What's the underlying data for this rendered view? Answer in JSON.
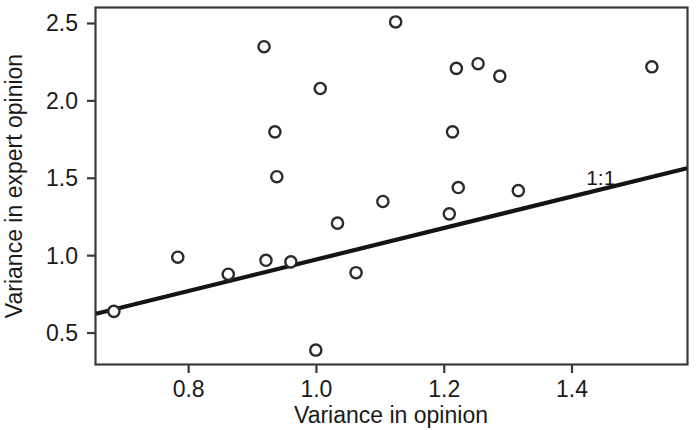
{
  "chart_data": {
    "type": "scatter",
    "title": "",
    "xlabel": "Variance in opinion",
    "ylabel": "Variance in expert opinion",
    "xlim": [
      0.655,
      1.58
    ],
    "ylim": [
      0.3,
      2.6
    ],
    "xticks": [
      0.8,
      1.0,
      1.2,
      1.4
    ],
    "xtick_labels": [
      "0.8",
      "1.0",
      "1.2",
      "1.4"
    ],
    "yticks": [
      0.5,
      1.0,
      1.5,
      2.0,
      2.5
    ],
    "ytick_labels": [
      "0.5",
      "1.0",
      "1.5",
      "2.0",
      "2.5"
    ],
    "grid": false,
    "legend": "none",
    "marker": "open-circle",
    "points": [
      {
        "x": 0.683,
        "y": 0.64
      },
      {
        "x": 0.783,
        "y": 0.99
      },
      {
        "x": 0.862,
        "y": 0.88
      },
      {
        "x": 0.918,
        "y": 2.35
      },
      {
        "x": 0.921,
        "y": 0.97
      },
      {
        "x": 0.935,
        "y": 1.8
      },
      {
        "x": 0.938,
        "y": 1.51
      },
      {
        "x": 0.96,
        "y": 0.96
      },
      {
        "x": 0.999,
        "y": 0.39
      },
      {
        "x": 1.006,
        "y": 2.08
      },
      {
        "x": 1.033,
        "y": 1.21
      },
      {
        "x": 1.062,
        "y": 0.89
      },
      {
        "x": 1.104,
        "y": 1.35
      },
      {
        "x": 1.124,
        "y": 2.51
      },
      {
        "x": 1.208,
        "y": 1.27
      },
      {
        "x": 1.213,
        "y": 1.8
      },
      {
        "x": 1.219,
        "y": 2.21
      },
      {
        "x": 1.222,
        "y": 1.44
      },
      {
        "x": 1.253,
        "y": 2.24
      },
      {
        "x": 1.287,
        "y": 2.16
      },
      {
        "x": 1.316,
        "y": 1.42
      },
      {
        "x": 1.525,
        "y": 2.22
      }
    ],
    "reference_line": {
      "label": "1:1",
      "label_x": 1.445,
      "label_y": 1.455,
      "x0": 0.655,
      "y0": 0.625,
      "x1": 1.58,
      "y1": 1.565
    }
  },
  "colors": {
    "axis": "#3a3a3a",
    "marker_stroke": "#2b2b2b",
    "marker_fill": "#ffffff",
    "line": "#141414",
    "text": "#1a1a1a",
    "background": "#ffffff"
  }
}
